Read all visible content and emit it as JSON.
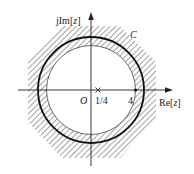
{
  "diagram": {
    "axes": {
      "imag_label_prefix": "jIm[",
      "imag_label_var": "z",
      "imag_label_suffix": "]",
      "real_label_prefix": "Re[",
      "real_label_var": "z",
      "real_label_suffix": "]",
      "origin_label": "O"
    },
    "contour_label": "C",
    "points": [
      {
        "label": "1/4",
        "value": 0.25,
        "marker": "cross"
      },
      {
        "label": "4",
        "value": 4,
        "marker": "dot"
      }
    ],
    "region": {
      "description": "annular convergence region, hatched",
      "inner_radius": 4
    },
    "colors": {
      "ink": "#222222",
      "hatch": "#555555",
      "background": "#ffffff"
    }
  }
}
